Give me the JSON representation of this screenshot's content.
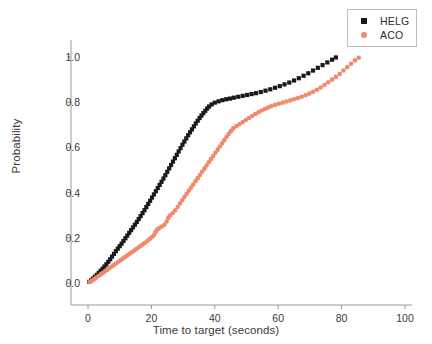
{
  "chart_data": {
    "type": "scatter",
    "title": "",
    "xlabel": "Time to target (seconds)",
    "ylabel": "Probability",
    "xlim": [
      -5,
      105
    ],
    "ylim": [
      -0.06,
      1.08
    ],
    "xticks": [
      0,
      20,
      40,
      60,
      80,
      100
    ],
    "xtick_labels": [
      "0",
      "20",
      "40",
      "60",
      "80",
      "100"
    ],
    "yticks": [
      0.0,
      0.2,
      0.4,
      0.6,
      0.8,
      1.0
    ],
    "ytick_labels": [
      "0.0",
      "0.2",
      "0.4",
      "0.6",
      "0.8",
      "1.0"
    ],
    "grid": false,
    "legend_position": "upper right",
    "spines": [
      "left",
      "bottom"
    ],
    "series": [
      {
        "name": "HELG",
        "marker": "square",
        "color": "#1a1a1a",
        "marker_size": 4.2,
        "points": [
          [
            0.4,
            0.005
          ],
          [
            1.0,
            0.012
          ],
          [
            1.6,
            0.02
          ],
          [
            2.2,
            0.028
          ],
          [
            2.8,
            0.036
          ],
          [
            3.4,
            0.045
          ],
          [
            4.0,
            0.054
          ],
          [
            4.6,
            0.063
          ],
          [
            5.2,
            0.073
          ],
          [
            5.8,
            0.083
          ],
          [
            6.4,
            0.094
          ],
          [
            7.0,
            0.105
          ],
          [
            7.6,
            0.117
          ],
          [
            8.2,
            0.129
          ],
          [
            8.8,
            0.141
          ],
          [
            9.4,
            0.152
          ],
          [
            10.0,
            0.163
          ],
          [
            10.6,
            0.174
          ],
          [
            11.2,
            0.186
          ],
          [
            11.8,
            0.198
          ],
          [
            12.4,
            0.21
          ],
          [
            13.0,
            0.222
          ],
          [
            13.6,
            0.234
          ],
          [
            14.2,
            0.246
          ],
          [
            14.8,
            0.258
          ],
          [
            15.4,
            0.27
          ],
          [
            16.0,
            0.283
          ],
          [
            16.6,
            0.296
          ],
          [
            17.2,
            0.309
          ],
          [
            17.8,
            0.322
          ],
          [
            18.4,
            0.336
          ],
          [
            19.0,
            0.35
          ],
          [
            19.6,
            0.364
          ],
          [
            20.2,
            0.378
          ],
          [
            20.8,
            0.392
          ],
          [
            21.4,
            0.406
          ],
          [
            22.0,
            0.42
          ],
          [
            22.6,
            0.434
          ],
          [
            23.2,
            0.448
          ],
          [
            23.8,
            0.462
          ],
          [
            24.4,
            0.477
          ],
          [
            25.0,
            0.492
          ],
          [
            25.6,
            0.507
          ],
          [
            26.2,
            0.522
          ],
          [
            26.8,
            0.537
          ],
          [
            27.4,
            0.552
          ],
          [
            28.0,
            0.567
          ],
          [
            28.6,
            0.582
          ],
          [
            29.2,
            0.597
          ],
          [
            29.8,
            0.612
          ],
          [
            30.4,
            0.626
          ],
          [
            31.0,
            0.64
          ],
          [
            31.6,
            0.654
          ],
          [
            32.2,
            0.667
          ],
          [
            32.8,
            0.68
          ],
          [
            33.4,
            0.693
          ],
          [
            34.0,
            0.706
          ],
          [
            34.6,
            0.718
          ],
          [
            35.2,
            0.73
          ],
          [
            35.8,
            0.741
          ],
          [
            36.4,
            0.752
          ],
          [
            37.0,
            0.762
          ],
          [
            37.6,
            0.772
          ],
          [
            38.2,
            0.781
          ],
          [
            39.0,
            0.79
          ],
          [
            40.0,
            0.798
          ],
          [
            41.2,
            0.804
          ],
          [
            42.4,
            0.809
          ],
          [
            43.6,
            0.813
          ],
          [
            44.8,
            0.816
          ],
          [
            46.0,
            0.82
          ],
          [
            47.4,
            0.824
          ],
          [
            48.8,
            0.828
          ],
          [
            50.2,
            0.832
          ],
          [
            51.6,
            0.836
          ],
          [
            53.0,
            0.84
          ],
          [
            54.5,
            0.845
          ],
          [
            56.0,
            0.851
          ],
          [
            57.5,
            0.857
          ],
          [
            59.0,
            0.864
          ],
          [
            60.5,
            0.871
          ],
          [
            62.0,
            0.879
          ],
          [
            63.5,
            0.887
          ],
          [
            65.0,
            0.896
          ],
          [
            66.5,
            0.906
          ],
          [
            68.0,
            0.917
          ],
          [
            69.5,
            0.928
          ],
          [
            71.0,
            0.94
          ],
          [
            72.5,
            0.952
          ],
          [
            74.0,
            0.964
          ],
          [
            75.5,
            0.976
          ],
          [
            77.0,
            0.988
          ],
          [
            78.2,
            0.998
          ]
        ]
      },
      {
        "name": "ACO",
        "marker": "circle",
        "color": "#f08a6c",
        "marker_size": 4.6,
        "points": [
          [
            0.5,
            0.004
          ],
          [
            1.2,
            0.01
          ],
          [
            1.9,
            0.017
          ],
          [
            2.6,
            0.024
          ],
          [
            3.3,
            0.031
          ],
          [
            4.0,
            0.038
          ],
          [
            4.7,
            0.045
          ],
          [
            5.4,
            0.052
          ],
          [
            6.1,
            0.059
          ],
          [
            6.8,
            0.066
          ],
          [
            7.5,
            0.073
          ],
          [
            8.2,
            0.08
          ],
          [
            8.9,
            0.087
          ],
          [
            9.6,
            0.094
          ],
          [
            10.3,
            0.101
          ],
          [
            11.0,
            0.108
          ],
          [
            11.7,
            0.115
          ],
          [
            12.4,
            0.122
          ],
          [
            13.1,
            0.129
          ],
          [
            13.8,
            0.136
          ],
          [
            14.5,
            0.143
          ],
          [
            15.2,
            0.15
          ],
          [
            15.9,
            0.157
          ],
          [
            16.6,
            0.164
          ],
          [
            17.3,
            0.171
          ],
          [
            18.0,
            0.178
          ],
          [
            18.7,
            0.186
          ],
          [
            19.4,
            0.194
          ],
          [
            20.1,
            0.202
          ],
          [
            20.8,
            0.212
          ],
          [
            21.3,
            0.225
          ],
          [
            21.8,
            0.236
          ],
          [
            22.5,
            0.243
          ],
          [
            23.3,
            0.25
          ],
          [
            24.1,
            0.258
          ],
          [
            24.8,
            0.272
          ],
          [
            25.3,
            0.288
          ],
          [
            25.9,
            0.3
          ],
          [
            26.7,
            0.31
          ],
          [
            27.5,
            0.322
          ],
          [
            28.3,
            0.336
          ],
          [
            29.0,
            0.352
          ],
          [
            29.7,
            0.366
          ],
          [
            30.4,
            0.38
          ],
          [
            31.1,
            0.394
          ],
          [
            31.8,
            0.408
          ],
          [
            32.5,
            0.422
          ],
          [
            33.2,
            0.436
          ],
          [
            33.9,
            0.45
          ],
          [
            34.6,
            0.464
          ],
          [
            35.3,
            0.478
          ],
          [
            36.0,
            0.492
          ],
          [
            36.7,
            0.506
          ],
          [
            37.4,
            0.52
          ],
          [
            38.1,
            0.534
          ],
          [
            38.8,
            0.548
          ],
          [
            39.5,
            0.562
          ],
          [
            40.2,
            0.576
          ],
          [
            40.9,
            0.59
          ],
          [
            41.6,
            0.604
          ],
          [
            42.3,
            0.618
          ],
          [
            43.0,
            0.632
          ],
          [
            43.7,
            0.646
          ],
          [
            44.4,
            0.66
          ],
          [
            45.1,
            0.672
          ],
          [
            45.8,
            0.684
          ],
          [
            46.8,
            0.694
          ],
          [
            47.8,
            0.703
          ],
          [
            48.8,
            0.712
          ],
          [
            49.8,
            0.721
          ],
          [
            50.8,
            0.73
          ],
          [
            51.8,
            0.739
          ],
          [
            52.8,
            0.748
          ],
          [
            53.8,
            0.756
          ],
          [
            54.8,
            0.763
          ],
          [
            55.8,
            0.77
          ],
          [
            56.8,
            0.776
          ],
          [
            57.8,
            0.782
          ],
          [
            59.0,
            0.788
          ],
          [
            60.2,
            0.793
          ],
          [
            61.4,
            0.798
          ],
          [
            62.6,
            0.803
          ],
          [
            63.8,
            0.808
          ],
          [
            65.0,
            0.813
          ],
          [
            66.2,
            0.818
          ],
          [
            67.4,
            0.824
          ],
          [
            68.6,
            0.831
          ],
          [
            69.8,
            0.838
          ],
          [
            71.0,
            0.846
          ],
          [
            72.2,
            0.855
          ],
          [
            73.4,
            0.865
          ],
          [
            74.6,
            0.876
          ],
          [
            75.8,
            0.888
          ],
          [
            77.0,
            0.9
          ],
          [
            78.2,
            0.912
          ],
          [
            79.4,
            0.925
          ],
          [
            80.6,
            0.94
          ],
          [
            81.8,
            0.955
          ],
          [
            83.0,
            0.97
          ],
          [
            84.2,
            0.985
          ],
          [
            85.4,
            0.997
          ]
        ]
      }
    ]
  },
  "legend": {
    "entries": [
      {
        "label": "HELG",
        "marker": "square-marker-icon"
      },
      {
        "label": "ACO",
        "marker": "circle-marker-icon"
      }
    ]
  }
}
